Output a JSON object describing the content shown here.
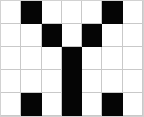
{
  "image": {
    "title": "Black and white grid pattern",
    "width": 144,
    "height": 117,
    "background_color": "#ffffff",
    "fill_color": "#050505",
    "gridline_color": "#c9c9c9",
    "frame_color": "#d2d2d2"
  },
  "grid": {
    "columns": 7,
    "rows": 5,
    "on_label": "filled",
    "off_label": "empty",
    "cells": [
      [
        0,
        1,
        0,
        0,
        0,
        1,
        0
      ],
      [
        0,
        0,
        1,
        0,
        1,
        0,
        0
      ],
      [
        0,
        0,
        0,
        1,
        0,
        0,
        0
      ],
      [
        0,
        0,
        0,
        1,
        0,
        0,
        0
      ],
      [
        0,
        1,
        0,
        1,
        0,
        1,
        0
      ]
    ],
    "filled_coordinates": [
      {
        "row": 0,
        "col": 1
      },
      {
        "row": 0,
        "col": 5
      },
      {
        "row": 1,
        "col": 2
      },
      {
        "row": 1,
        "col": 4
      },
      {
        "row": 2,
        "col": 3
      },
      {
        "row": 3,
        "col": 3
      },
      {
        "row": 4,
        "col": 1
      },
      {
        "row": 4,
        "col": 3
      },
      {
        "row": 4,
        "col": 5
      }
    ],
    "filled_count": 9,
    "empty_count": 26
  }
}
